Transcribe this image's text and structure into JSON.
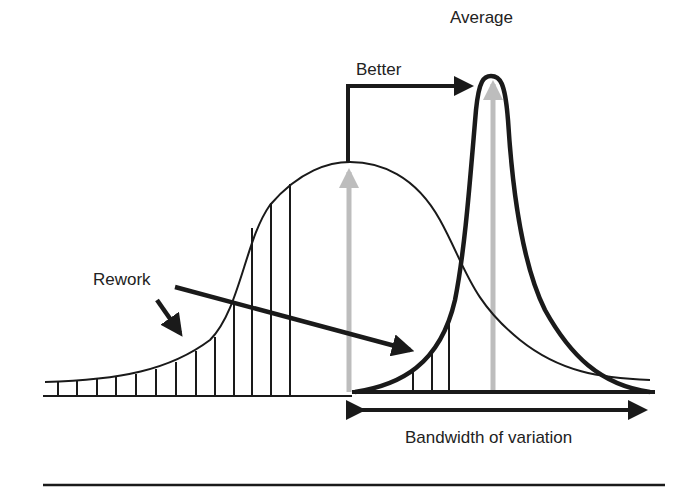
{
  "diagram": {
    "labels": {
      "average": "Average",
      "better": "Better",
      "rework": "Rework",
      "bandwidth": "Bandwidth of variation"
    },
    "colors": {
      "line": "#1a1a1a",
      "mean_arrow": "#bdbdbd",
      "background": "#ffffff"
    },
    "curves": [
      {
        "name": "wide-distribution",
        "peak_x": 348,
        "peak_y": 162,
        "style": "thin"
      },
      {
        "name": "narrow-distribution",
        "peak_x": 490,
        "peak_y": 76,
        "style": "thick"
      }
    ]
  }
}
